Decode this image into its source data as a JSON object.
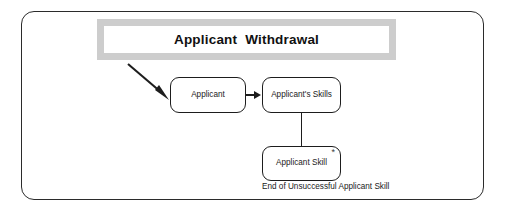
{
  "diagram": {
    "title": "Applicant  Withdrawal",
    "nodes": [
      {
        "id": "applicant",
        "label": "Applicant"
      },
      {
        "id": "applicants_skills",
        "label": "Applicant's Skills"
      },
      {
        "id": "applicant_skill",
        "label": "Applicant Skill",
        "multiplicity": "*"
      }
    ],
    "caption": "End of Unsuccessful Applicant Skill",
    "icons": {
      "entry_arrow": "diagonal-arrow-icon",
      "flow_arrow": "right-arrow-icon",
      "link_line": "vertical-connector-icon"
    },
    "colors": {
      "stroke": "#1d1d1d",
      "title_border": "#cdcdcd",
      "background": "#ffffff",
      "text": "#1a1a1a"
    }
  }
}
